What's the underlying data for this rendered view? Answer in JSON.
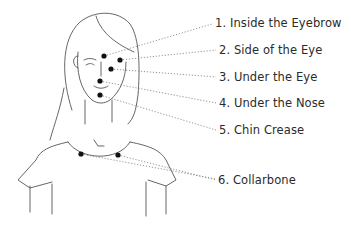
{
  "diagram": {
    "type": "tapping points illustration",
    "line_color": "#555555",
    "dot_color": "#111111",
    "points": [
      {
        "id": 1,
        "label": "1. Inside the Eyebrow",
        "dot": [
          104,
          56
        ],
        "label_pos": [
          212,
          17
        ]
      },
      {
        "id": 2,
        "label": "2. Side of the Eye",
        "dot": [
          120,
          60
        ],
        "label_pos": [
          218,
          43
        ]
      },
      {
        "id": 3,
        "label": "3. Under the Eye",
        "dot": [
          111,
          69
        ],
        "label_pos": [
          218,
          70
        ]
      },
      {
        "id": 4,
        "label": "4. Under the Nose",
        "dot": [
          100,
          81
        ],
        "label_pos": [
          218,
          96
        ]
      },
      {
        "id": 5,
        "label": "5. Chin Crease",
        "dot": [
          100,
          95
        ],
        "label_pos": [
          218,
          123
        ]
      },
      {
        "id": 6,
        "label": "6. Collarbone",
        "dot": [
          118,
          155
        ],
        "label_pos": [
          218,
          173
        ]
      }
    ],
    "extra_dots": [
      [
        81,
        154
      ]
    ]
  }
}
